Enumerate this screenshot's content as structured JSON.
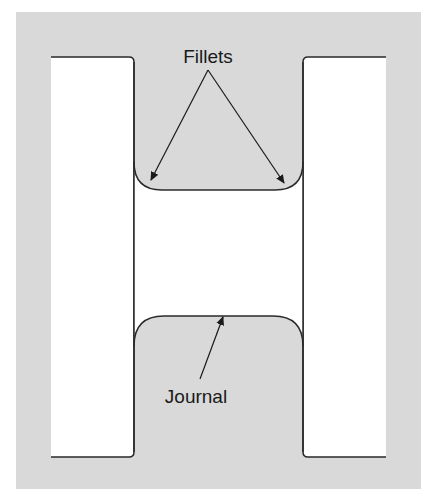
{
  "diagram": {
    "type": "crankshaft-journal-cross-section",
    "labels": {
      "fillets": "Fillets",
      "journal": "Journal"
    },
    "colors": {
      "background": "#ffffff",
      "material": "#d9d9d9",
      "outline": "#2a2a2a",
      "arrow": "#1a1a1a"
    },
    "annotations": [
      {
        "label": "Fillets",
        "targets": [
          "left-fillet",
          "right-fillet"
        ]
      },
      {
        "label": "Journal",
        "targets": [
          "journal-surface"
        ]
      }
    ]
  }
}
